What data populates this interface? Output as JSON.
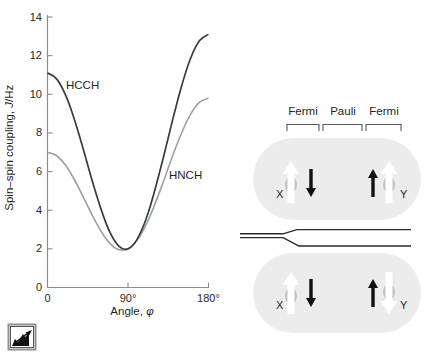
{
  "chart_data": {
    "type": "line",
    "title": "",
    "xlabel_parts": {
      "prefix": "Angle, ",
      "symbol": "φ"
    },
    "ylabel_parts": {
      "prefix": "Spin–spin coupling, ",
      "symbol": "J",
      "suffix": "/Hz"
    },
    "xlim": [
      0,
      180
    ],
    "ylim": [
      0,
      14
    ],
    "grid": false,
    "xticks": [
      {
        "value": 0,
        "label": "0"
      },
      {
        "value": 90,
        "label": "90°"
      },
      {
        "value": 180,
        "label": "180°"
      }
    ],
    "yticks": [
      0,
      2,
      4,
      6,
      8,
      10,
      12,
      14
    ],
    "x": [
      0,
      10,
      20,
      30,
      40,
      50,
      60,
      70,
      80,
      90,
      100,
      110,
      120,
      130,
      140,
      150,
      160,
      170,
      180
    ],
    "series": [
      {
        "name": "HCCH",
        "color": "#373c42",
        "values": [
          11.1,
          10.81,
          9.98,
          8.71,
          7.16,
          5.53,
          4.03,
          2.84,
          2.13,
          2.0,
          2.48,
          3.52,
          5.03,
          6.82,
          8.69,
          10.44,
          11.86,
          12.78,
          13.1
        ]
      },
      {
        "name": "HNCH",
        "color": "#9ba1a6",
        "values": [
          7.0,
          6.83,
          6.34,
          5.59,
          4.68,
          3.74,
          2.9,
          2.27,
          1.95,
          2.0,
          2.44,
          3.23,
          4.3,
          5.54,
          6.83,
          8.01,
          8.97,
          9.59,
          9.8
        ]
      }
    ]
  },
  "diagram": {
    "mechanism_labels": [
      "Fermi",
      "Pauli",
      "Fermi"
    ],
    "upper": {
      "left_nucleus": "X",
      "right_nucleus": "Y"
    },
    "lower": {
      "left_nucleus": "X",
      "right_nucleus": "Y"
    },
    "colors": {
      "molecule_fill": "#ececec",
      "nucleus_gray": "#c2c2c2",
      "electron_arrow": "#111111"
    }
  }
}
